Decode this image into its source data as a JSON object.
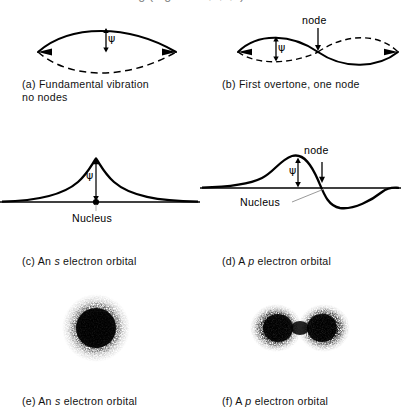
{
  "page": {
    "cutoff_top_text": "and vibrations of a string (Fig. 5-3 a,b,c,d).",
    "background": "#ffffff",
    "ink": "#000000"
  },
  "panels": [
    {
      "id": "a",
      "caption": "(a) Fundamental vibration\n      no nodes",
      "kind": "string-vibration",
      "labels": {
        "amplitude": "ψ"
      },
      "nodes": 0
    },
    {
      "id": "b",
      "caption": "(b) First overtone, one node",
      "kind": "string-vibration",
      "labels": {
        "amplitude": "ψ",
        "node": "node"
      },
      "nodes": 1
    },
    {
      "id": "c",
      "caption_parts": {
        "prefix": "(c) An ",
        "italic": "s",
        "suffix": " electron orbital"
      },
      "caption": "(c) An s electron orbital",
      "kind": "wavefunction-plot",
      "labels": {
        "amplitude": "ψ",
        "nucleus": "Nucleus"
      },
      "nodes": 0
    },
    {
      "id": "d",
      "caption_parts": {
        "prefix": "(d) A ",
        "italic": "p",
        "suffix": " electron orbital"
      },
      "caption": "(d) A p electron orbital",
      "kind": "wavefunction-plot",
      "labels": {
        "amplitude": "ψ",
        "nucleus": "Nucleus",
        "node": "node"
      },
      "nodes": 1
    },
    {
      "id": "e",
      "caption_parts": {
        "prefix": "(e) An ",
        "italic": "s",
        "suffix": " electron orbital"
      },
      "caption": "(e) An s electron orbital",
      "kind": "electron-density-cloud",
      "shape": "spherical"
    },
    {
      "id": "f",
      "caption_parts": {
        "prefix": "(f) A ",
        "italic": "p",
        "suffix": " electron orbital"
      },
      "caption": "(f) A p electron orbital",
      "kind": "electron-density-cloud",
      "shape": "dumbbell"
    }
  ]
}
